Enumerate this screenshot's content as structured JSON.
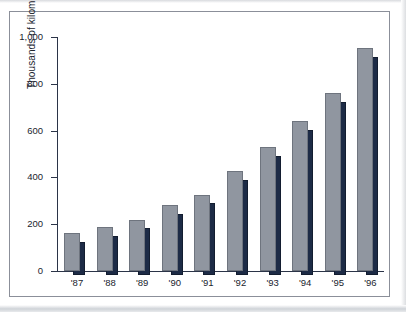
{
  "chart_data": {
    "type": "bar",
    "title": "",
    "subtitle": "",
    "xlabel": "",
    "ylabel": "Thousands of kilometers",
    "categories": [
      "'87",
      "'88",
      "'89",
      "'90",
      "'91",
      "'92",
      "'93",
      "'94",
      "'95",
      "'96"
    ],
    "series": [
      {
        "name": "front-series",
        "color": "#9096a0",
        "values": [
          162,
          187,
          219,
          280,
          326,
          428,
          530,
          640,
          760,
          952
        ]
      },
      {
        "name": "back-series",
        "color": "#1d2b46",
        "values": [
          141,
          166,
          199,
          259,
          306,
          408,
          508,
          620,
          740,
          930
        ]
      }
    ],
    "ylim": [
      0,
      1000
    ],
    "yticks": [
      0,
      200,
      400,
      600,
      800,
      1000
    ],
    "ytick_labels": [
      "0",
      "200",
      "400",
      "600",
      "800",
      "1,000"
    ],
    "grid": false,
    "legend": "none",
    "annotations": []
  },
  "frame": {
    "border_color": "#8b8f99",
    "background": "#ffffff"
  },
  "axis": {
    "color": "#2b3448"
  }
}
